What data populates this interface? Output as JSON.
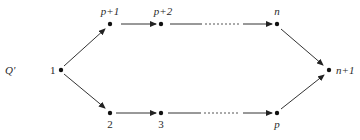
{
  "diagram": {
    "title_label": "Q'",
    "colors": {
      "stroke": "#333333",
      "node": "#111111",
      "text": "#2a2a2a",
      "background": "#ffffff"
    },
    "nodes": [
      {
        "id": "1",
        "label": "1",
        "x": 61,
        "y": 70,
        "label_pos": "left"
      },
      {
        "id": "p+1",
        "label": "p+1",
        "x": 110,
        "y": 24,
        "label_pos": "above"
      },
      {
        "id": "p+2",
        "label": "p+2",
        "x": 161,
        "y": 24,
        "label_pos": "above"
      },
      {
        "id": "n",
        "label": "n",
        "x": 277,
        "y": 24,
        "label_pos": "above"
      },
      {
        "id": "n+1",
        "label": "n+1",
        "x": 329,
        "y": 70,
        "label_pos": "right"
      },
      {
        "id": "2",
        "label": "2",
        "x": 110,
        "y": 113,
        "label_pos": "below"
      },
      {
        "id": "3",
        "label": "3",
        "x": 161,
        "y": 113,
        "label_pos": "below"
      },
      {
        "id": "p",
        "label": "p",
        "x": 277,
        "y": 113,
        "label_pos": "below"
      }
    ],
    "edges": [
      {
        "from": "1",
        "to": "p+1",
        "style": "solid"
      },
      {
        "from": "p+1",
        "to": "p+2",
        "style": "solid"
      },
      {
        "from": "p+2",
        "to": "n",
        "style": "solid-dotted-solid"
      },
      {
        "from": "n",
        "to": "n+1",
        "style": "solid"
      },
      {
        "from": "1",
        "to": "2",
        "style": "solid"
      },
      {
        "from": "2",
        "to": "3",
        "style": "solid"
      },
      {
        "from": "3",
        "to": "p",
        "style": "solid-dotted-solid"
      },
      {
        "from": "p",
        "to": "n+1",
        "style": "solid"
      }
    ]
  }
}
